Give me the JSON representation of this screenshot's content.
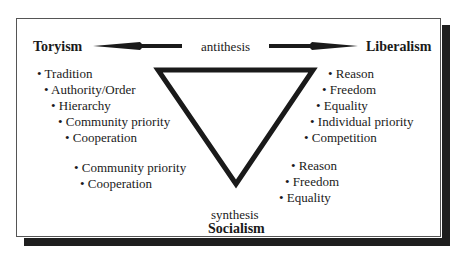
{
  "diagram": {
    "toryism": {
      "title": "Toryism",
      "items": [
        "• Tradition",
        "• Authority/Order",
        "• Hierarchy",
        "• Community priority",
        "• Cooperation"
      ]
    },
    "liberalism": {
      "title": "Liberalism",
      "items": [
        "• Reason",
        "• Freedom",
        "• Equality",
        "• Individual priority",
        "• Competition"
      ]
    },
    "socialism": {
      "label": "synthesis",
      "title": "Socialism",
      "from_toryism": [
        "• Community priority",
        "• Cooperation"
      ],
      "from_liberalism": [
        "• Reason",
        "• Freedom",
        "• Equality"
      ]
    },
    "antithesis_label": "antithesis",
    "colors": {
      "ink": "#1a1a1a",
      "shadow": "#1e1e1e",
      "frame": "#555555"
    }
  }
}
